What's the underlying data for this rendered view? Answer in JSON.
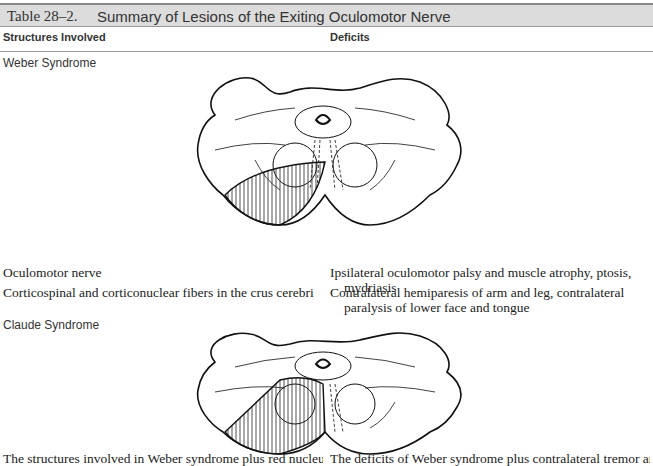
{
  "table": {
    "number": "Table 28–2.",
    "title": "Summary of Lesions of the Exiting Oculomotor Nerve",
    "columns": [
      "Structures Involved",
      "Deficits"
    ]
  },
  "sections": [
    {
      "name": "Weber Syndrome",
      "figure": "midbrain-cross-section-weber-lesion",
      "rows": [
        {
          "structure": "Oculomotor nerve",
          "deficit": "Ipsilateral oculomotor palsy and muscle atrophy, ptosis, mydriasis"
        },
        {
          "structure": "Corticospinal and corticonuclear fibers in the crus cerebri",
          "deficit": "Contralateral hemiparesis of arm and leg, contralateral paralysis of lower face and tongue"
        }
      ]
    },
    {
      "name": "Claude Syndrome",
      "figure": "midbrain-cross-section-claude-lesion",
      "rows": [
        {
          "structure": "The structures involved in Weber syndrome plus red nucleus and",
          "deficit": "The deficits of Weber syndrome plus contralateral tremor and ataxia"
        }
      ]
    }
  ]
}
